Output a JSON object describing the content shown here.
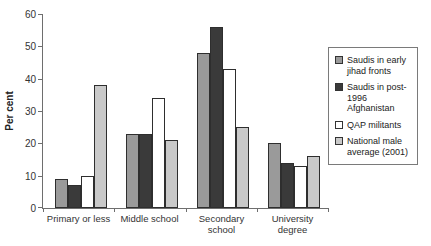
{
  "chart_data": {
    "type": "bar",
    "ylabel": "Per cent",
    "categories": [
      "Primary or less",
      "Middle school",
      "Secondary\nschool",
      "University\ndegree"
    ],
    "series": [
      {
        "name": "Saudis in early\njihad fronts",
        "color": "#9a9a9a",
        "values": [
          9,
          23,
          48,
          20
        ]
      },
      {
        "name": "Saudis in post-\n1996 Afghanistan",
        "color": "#3a3a3a",
        "values": [
          7,
          23,
          56,
          14
        ]
      },
      {
        "name": "QAP militants",
        "color": "#ffffff",
        "values": [
          10,
          34,
          43,
          13
        ]
      },
      {
        "name": "National male\naverage (2001)",
        "color": "#c9c9c9",
        "values": [
          38,
          21,
          25,
          16
        ]
      }
    ],
    "ylim": [
      0,
      60
    ],
    "yticks": [
      0,
      10,
      20,
      30,
      40,
      50,
      60
    ],
    "grid": false,
    "legend_position": "right",
    "axis_color": "#6e6e6e"
  }
}
